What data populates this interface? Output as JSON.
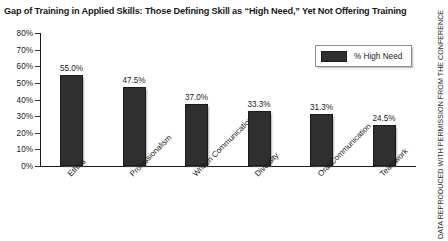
{
  "chart_data": {
    "type": "bar",
    "title": "Gap of Training in Applied Skills: Those Defining Skill as “High Need,” Yet Not Offering Training",
    "categories": [
      "Ethics",
      "Professionalism",
      "Written Communication",
      "Diversity",
      "Oral Communication",
      "Teamwork"
    ],
    "values": [
      55.0,
      47.5,
      37.0,
      33.3,
      31.3,
      24.5
    ],
    "value_labels": [
      "55.0%",
      "47.5%",
      "37.0%",
      "33.3%",
      "31.3%",
      "24.5%"
    ],
    "series": [
      {
        "name": "% High Need",
        "values": [
          55.0,
          47.5,
          37.0,
          33.3,
          31.3,
          24.5
        ]
      }
    ],
    "xlabel": "",
    "ylabel": "",
    "ylim": [
      0,
      80
    ],
    "ytick_labels": [
      "80%",
      "70%",
      "60%",
      "50%",
      "40%",
      "30%",
      "20%",
      "10%",
      "0%"
    ],
    "ytick_values": [
      80,
      70,
      60,
      50,
      40,
      30,
      20,
      10,
      0
    ],
    "grid": false,
    "legend_position": "top-right",
    "bar_color": "#2f2f2f"
  },
  "legend": {
    "entries": [
      {
        "label": "% High Need",
        "color": "#2f2f2f"
      }
    ]
  },
  "credit": {
    "text": "DATA REPRODUCED WITH PERMISSION FROM THE CONFERENCE"
  }
}
